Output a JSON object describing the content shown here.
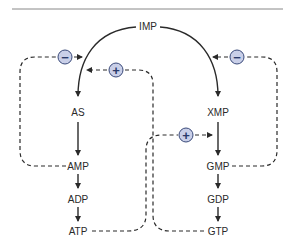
{
  "diagram": {
    "nodes": {
      "imp": "IMP",
      "as": "AS",
      "amp": "AMP",
      "adp": "ADP",
      "atp": "ATP",
      "xmp": "XMP",
      "gmp": "GMP",
      "gdp": "GDP",
      "gtp": "GTP"
    },
    "regulators": {
      "amp_inhibits_imp_to_as": "−",
      "gtp_activates_imp_to_as": "+",
      "gmp_inhibits_imp_to_xmp": "−",
      "atp_activates_xmp_to_gmp": "+"
    },
    "colors": {
      "line": "#2a2a2a",
      "regulator_fill": "#c9cfe8",
      "regulator_stroke": "#3a4a7a",
      "top_rule": "#888888"
    }
  }
}
